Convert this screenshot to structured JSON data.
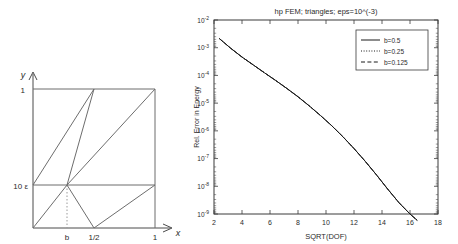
{
  "figure": {
    "left_diagram": {
      "name": "geometric-mesh-diagram",
      "axis_x_label": "x",
      "axis_y_label": "y",
      "y_ticks": [
        {
          "label": "1",
          "value": 1.0
        },
        {
          "label": "10 ε",
          "value": 0.3
        }
      ],
      "x_ticks": [
        {
          "label": "b",
          "value": 0.28
        },
        {
          "label": "1/2",
          "value": 0.5
        },
        {
          "label": "1",
          "value": 1.0
        }
      ],
      "description": "Unit square partitioned into triangles with a refinement node at (b, 10 eps)"
    }
  },
  "chart_data": {
    "type": "line",
    "title": "hp FEM; triangles; eps=10^(-3)",
    "xlabel": "SQRT(DOF)",
    "ylabel": "Rel. Error in Energy",
    "xscale": "linear",
    "yscale": "log",
    "xlim": [
      2,
      18
    ],
    "ylim": [
      1e-09,
      0.01
    ],
    "grid": false,
    "xticks": [
      2,
      4,
      6,
      8,
      10,
      12,
      14,
      16,
      18
    ],
    "xticklabels": [
      "2",
      "4",
      "6",
      "8",
      "10",
      "12",
      "14",
      "16",
      "18"
    ],
    "yticks": [
      0.01,
      0.001,
      0.0001,
      1e-05,
      1e-06,
      1e-07,
      1e-08,
      1e-09
    ],
    "yticklabels": [
      "10^-2",
      "10^-3",
      "10^-4",
      "10^-5",
      "10^-6",
      "10^-7",
      "10^-8",
      "10^-9"
    ],
    "legend_position": "upper right",
    "series": [
      {
        "name": "b=0.5",
        "style": "solid",
        "color": "#1a1a1a",
        "x": [
          2.4,
          3.2,
          4.0,
          4.8,
          5.6,
          6.4,
          7.2,
          8.0,
          8.8,
          9.6,
          10.4,
          11.2,
          12.0,
          12.8,
          13.6,
          14.4,
          15.2,
          16.0,
          16.5
        ],
        "y": [
          0.0021,
          0.00095,
          0.00046,
          0.00024,
          0.000125,
          6.6e-05,
          3.4e-05,
          1.7e-05,
          8e-06,
          3.6e-06,
          1.55e-06,
          6.2e-07,
          2.3e-07,
          8e-08,
          2.6e-08,
          8e-09,
          2.6e-09,
          1e-09,
          6e-10
        ]
      },
      {
        "name": "b=0.25",
        "style": "dotted",
        "color": "#1a1a1a",
        "x": [
          2.4,
          3.2,
          4.0,
          4.8,
          5.6,
          6.4,
          7.2,
          8.0,
          8.8,
          9.6,
          10.4,
          11.2,
          12.0,
          12.8,
          13.6,
          14.4,
          15.2,
          16.0,
          16.5
        ],
        "y": [
          0.0021,
          0.00095,
          0.00046,
          0.00024,
          0.000125,
          6.6e-05,
          3.4e-05,
          1.7e-05,
          8e-06,
          3.6e-06,
          1.55e-06,
          6.2e-07,
          2.3e-07,
          8e-08,
          2.6e-08,
          8e-09,
          2.6e-09,
          1e-09,
          6e-10
        ]
      },
      {
        "name": "b=0.125",
        "style": "dashed",
        "color": "#1a1a1a",
        "x": [
          2.4,
          3.2,
          4.0,
          4.8,
          5.6,
          6.4,
          7.2,
          8.0,
          8.8,
          9.6,
          10.4,
          11.2,
          12.0,
          12.8,
          13.6,
          14.4,
          15.2,
          16.0,
          16.5
        ],
        "y": [
          0.0021,
          0.00095,
          0.00046,
          0.00024,
          0.000125,
          6.6e-05,
          3.4e-05,
          1.7e-05,
          8e-06,
          3.6e-06,
          1.55e-06,
          6.2e-07,
          2.3e-07,
          8e-08,
          2.6e-08,
          8e-09,
          2.6e-09,
          1e-09,
          6e-10
        ]
      }
    ]
  }
}
